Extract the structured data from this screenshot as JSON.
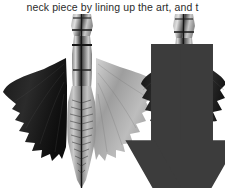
{
  "page": {
    "background_color": "#ffffff",
    "width": 225,
    "height": 188
  },
  "caption": {
    "text": "neck piece by lining up the art, and t",
    "color": "#2b2b2b",
    "truncated": true
  },
  "figure": {
    "name": "wing-neck-piece-photo",
    "type": "grayscale-photograph",
    "background_color": "#ffffff",
    "views": [
      {
        "id": "view-left",
        "label": "wings-spread-view",
        "parts": {
          "neck_column": "vertical segmented neck column with dark band",
          "left_wing": "dark scalloped membrane wing",
          "right_wing": "light gray scalloped membrane wing",
          "tail_body": "ribbed tail section with central seam"
        }
      },
      {
        "id": "view-right",
        "label": "wings-folded-view",
        "parts": {
          "neck_column": "vertical segmented neck column with dark band",
          "left_wing": "dark folded membrane wing",
          "right_wing": "dark folded membrane wing",
          "tail_body": "ribbed tail section with central seam"
        }
      }
    ],
    "annotations": [
      {
        "id": "arrow-left",
        "name": "down-arrow-icon",
        "direction": "down",
        "color": "#3c3c3c",
        "x": 55,
        "y": 44
      },
      {
        "id": "arrow-right",
        "name": "down-arrow-icon",
        "direction": "down",
        "color": "#3c3c3c",
        "x": 84,
        "y": 44
      }
    ],
    "palette": {
      "darkest": "#0e0e0e",
      "dark": "#2a2a2a",
      "mid": "#6e6e6e",
      "light": "#b4b4b4",
      "lightest": "#e4e4e4",
      "white": "#ffffff"
    }
  }
}
